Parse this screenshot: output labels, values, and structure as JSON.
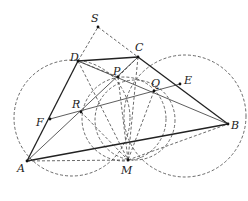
{
  "diagram": {
    "type": "geometry",
    "points": {
      "S": {
        "x": 98,
        "y": 27,
        "label": "S",
        "lx": 91,
        "ly": 22
      },
      "D": {
        "x": 78,
        "y": 61,
        "label": "D",
        "lx": 70,
        "ly": 61
      },
      "C": {
        "x": 138,
        "y": 57,
        "label": "C",
        "lx": 135,
        "ly": 51
      },
      "P": {
        "x": 118,
        "y": 77,
        "label": "P",
        "lx": 113,
        "ly": 75
      },
      "Q": {
        "x": 154,
        "y": 91,
        "label": "Q",
        "lx": 151,
        "ly": 87
      },
      "E": {
        "x": 180,
        "y": 84,
        "label": "E",
        "lx": 184,
        "ly": 84
      },
      "R": {
        "x": 81,
        "y": 112,
        "label": "R",
        "lx": 72,
        "ly": 108
      },
      "F": {
        "x": 50,
        "y": 119,
        "label": "F",
        "lx": 36,
        "ly": 126
      },
      "A": {
        "x": 27,
        "y": 161,
        "label": "A",
        "lx": 17,
        "ly": 172
      },
      "B": {
        "x": 228,
        "y": 124,
        "label": "B",
        "lx": 231,
        "ly": 129
      },
      "M": {
        "x": 128,
        "y": 160,
        "label": "M",
        "lx": 121,
        "ly": 174
      }
    }
  }
}
